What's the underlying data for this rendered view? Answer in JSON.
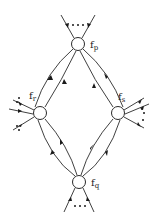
{
  "diagram": {
    "title": "",
    "nodes": [
      {
        "id": "p",
        "label": "f",
        "subscript": "p",
        "cx": 78,
        "cy": 44
      },
      {
        "id": "r",
        "label": "f",
        "subscript": "r",
        "cx": 40,
        "cy": 113
      },
      {
        "id": "s",
        "label": "f",
        "subscript": "s",
        "cx": 118,
        "cy": 113
      },
      {
        "id": "q",
        "label": "f",
        "subscript": "q",
        "cx": 79,
        "cy": 182
      }
    ],
    "edges": [
      {
        "from": "p",
        "to": "r",
        "count": 2,
        "directions": [
          "to-p",
          "to-r"
        ]
      },
      {
        "from": "p",
        "to": "s",
        "count": 2,
        "directions": [
          "to-s",
          "to-s"
        ]
      },
      {
        "from": "r",
        "to": "q",
        "count": 2,
        "directions": [
          "to-r",
          "to-q"
        ]
      },
      {
        "from": "s",
        "to": "q",
        "count": 2,
        "directions": [
          "to-s",
          "to-q"
        ]
      }
    ],
    "external_legs": {
      "p": {
        "count": 2,
        "ellipsis": "..."
      },
      "q": {
        "count": 2,
        "ellipsis": "..."
      },
      "r": {
        "count": 3,
        "ellipsis": "..."
      },
      "s": {
        "count": 3,
        "ellipsis": "..."
      }
    },
    "colors": {
      "line": "#2a2a2a",
      "background": "#ffffff"
    }
  }
}
